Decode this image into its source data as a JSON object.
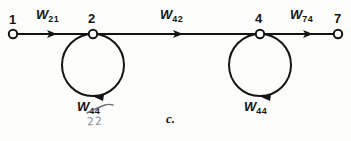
{
  "figure": {
    "caption": "c.",
    "background_color": "#fdfdfc",
    "ink_color": "#141414",
    "annotation_color": "#8d8d8d"
  },
  "nodes": [
    {
      "id": "1",
      "label": "1",
      "x": 13,
      "y": 34,
      "style": "open-circle"
    },
    {
      "id": "2",
      "label": "2",
      "x": 93,
      "y": 34,
      "style": "open-circle"
    },
    {
      "id": "4",
      "label": "4",
      "x": 260,
      "y": 34,
      "style": "open-circle"
    },
    {
      "id": "7",
      "label": "7",
      "x": 338,
      "y": 34,
      "style": "open-circle"
    }
  ],
  "node_labels": [
    {
      "text": "1",
      "x": 9,
      "y": 13
    },
    {
      "text": "2",
      "x": 88,
      "y": 12
    },
    {
      "text": "4",
      "x": 255,
      "y": 12
    },
    {
      "text": "7",
      "x": 334,
      "y": 12
    }
  ],
  "edges": [
    {
      "name": "edge-1-to-2",
      "from": "1",
      "to": "2",
      "weight_base": "W",
      "weight_sub": "21",
      "label_x": 36,
      "label_y": 8,
      "arrow_x": 56
    },
    {
      "name": "edge-2-to-4",
      "from": "2",
      "to": "4",
      "weight_base": "W",
      "weight_sub": "42",
      "label_x": 160,
      "label_y": 8,
      "arrow_x": 182
    },
    {
      "name": "edge-4-to-7",
      "from": "4",
      "to": "7",
      "weight_base": "W",
      "weight_sub": "74",
      "label_x": 290,
      "label_y": 8,
      "arrow_x": 312
    }
  ],
  "self_loops": [
    {
      "name": "self-loop-node-2",
      "at_node": "2",
      "center_x": 93,
      "center_y": 65,
      "radius": 31,
      "weight_base": "W",
      "weight_sub": "44",
      "label_x": 77,
      "label_y": 100,
      "correction": {
        "text": "22",
        "x": 87,
        "y": 118,
        "struck_through": "44"
      }
    },
    {
      "name": "self-loop-node-4",
      "at_node": "4",
      "center_x": 260,
      "center_y": 65,
      "radius": 31,
      "weight_base": "W",
      "weight_sub": "44",
      "label_x": 244,
      "label_y": 100,
      "correction": null
    }
  ],
  "caption_position": {
    "x": 166,
    "y": 112
  }
}
